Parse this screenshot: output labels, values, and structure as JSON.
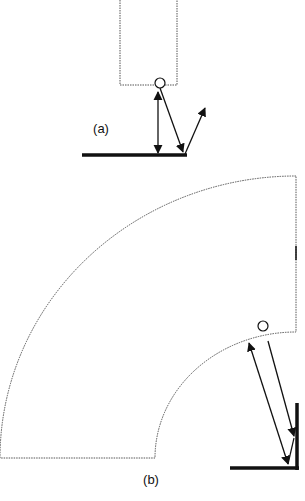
{
  "figure": {
    "panels": [
      {
        "id": "a",
        "label": "(a)"
      },
      {
        "id": "b",
        "label": "(b)"
      }
    ],
    "colors": {
      "stroke": "#111111",
      "dotted": "#555555",
      "background": "#ffffff"
    }
  }
}
